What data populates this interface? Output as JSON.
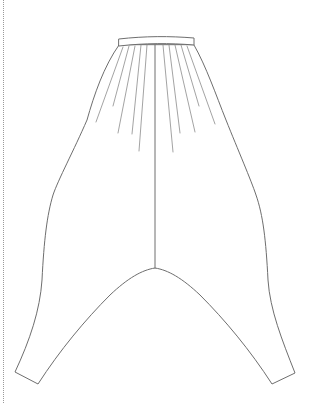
{
  "drawing": {
    "subject": "harem-pants-technical-flat",
    "view": "front",
    "colors": {
      "background": "#ffffff",
      "outline": "#6e6e6e",
      "pleats": "#8c8c8c",
      "guide": "#9a9a9a"
    },
    "waistband": {
      "left": 119,
      "right": 194,
      "top": 38,
      "bottom": 45
    },
    "center_seam": {
      "x": 155,
      "from_y": 45,
      "to_y": 268
    },
    "crotch_point": [
      155,
      268
    ],
    "left_hem": {
      "outer": [
        15,
        372
      ],
      "inner": [
        38,
        384
      ]
    },
    "right_hem": {
      "inner": [
        272,
        384
      ],
      "outer": [
        295,
        373
      ]
    },
    "pleats": {
      "left_count": 5,
      "right_count": 5
    },
    "guide_line": {
      "style": "dotted",
      "x": 3
    }
  }
}
